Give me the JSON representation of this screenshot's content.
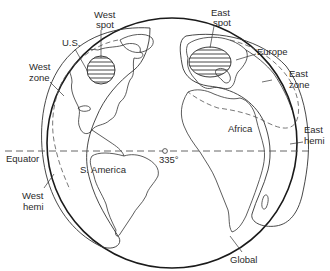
{
  "diagram": {
    "type": "satellite-coverage-globe",
    "labels": {
      "west_spot_line1": "West",
      "west_spot_line2": "spot",
      "east_spot_line1": "East",
      "east_spot_line2": "spot",
      "us": "U.S.",
      "europe": "Europe",
      "west_zone_line1": "West",
      "west_zone_line2": "zone",
      "east_zone_line1": "East",
      "east_zone_line2": "zone",
      "africa": "Africa",
      "east_hemi_line1": "East",
      "east_hemi_line2": "hemi",
      "west_hemi_line1": "West",
      "west_hemi_line2": "hemi",
      "equator": "Equator",
      "s_america": "S. America",
      "longitude": "335°",
      "global": "Global"
    },
    "beams": [
      {
        "name": "Global",
        "style": "solid-thick"
      },
      {
        "name": "West hemi",
        "style": "solid"
      },
      {
        "name": "East hemi",
        "style": "solid"
      },
      {
        "name": "West zone",
        "style": "dashed"
      },
      {
        "name": "East zone",
        "style": "dashed"
      },
      {
        "name": "West spot",
        "style": "hatched"
      },
      {
        "name": "East spot",
        "style": "hatched"
      }
    ],
    "colors": {
      "line": "#1a1a1a",
      "background": "#ffffff"
    }
  }
}
